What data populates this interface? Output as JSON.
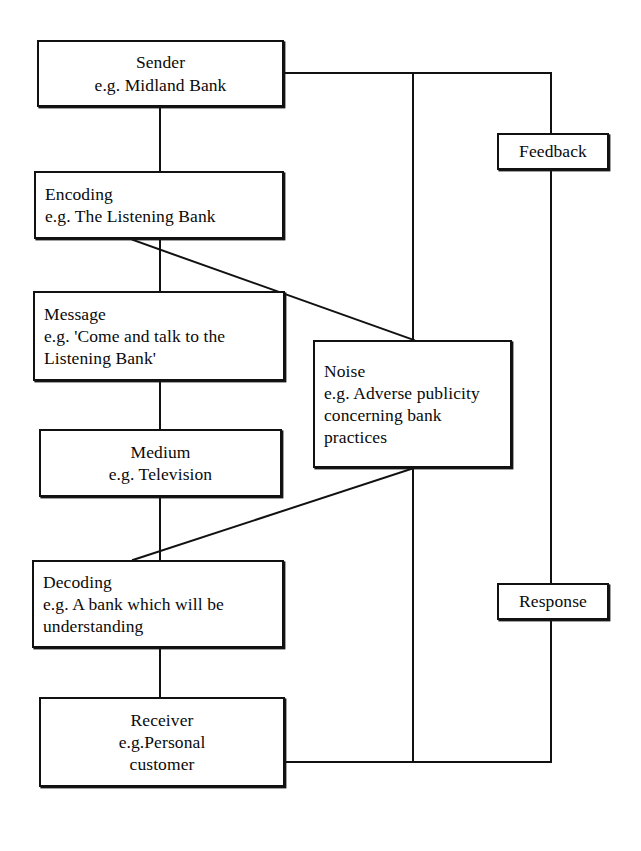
{
  "diagram": {
    "style": {
      "line_color": "#111111",
      "box_border_color": "#111111",
      "background": "#ffffff",
      "text_color": "#0a0a0a"
    },
    "nodes": [
      {
        "id": "sender",
        "label": "Sender\ne.g. Midland Bank",
        "align": "center",
        "x": 37,
        "y": 40,
        "w": 247,
        "h": 67
      },
      {
        "id": "encoding",
        "label": "Encoding\ne.g. The Listening Bank",
        "align": "left",
        "x": 34,
        "y": 171,
        "w": 250,
        "h": 68
      },
      {
        "id": "message",
        "label": "Message\ne.g. 'Come and talk to the\nListening Bank'",
        "align": "left",
        "x": 33,
        "y": 291,
        "w": 252,
        "h": 90
      },
      {
        "id": "medium",
        "label": "Medium\ne.g. Television",
        "align": "center",
        "x": 39,
        "y": 429,
        "w": 243,
        "h": 68
      },
      {
        "id": "decoding",
        "label": "Decoding\ne.g. A bank which will be\nunderstanding",
        "align": "left",
        "x": 32,
        "y": 560,
        "w": 252,
        "h": 88
      },
      {
        "id": "receiver",
        "label": "Receiver\ne.g.Personal\ncustomer",
        "align": "center",
        "x": 39,
        "y": 697,
        "w": 246,
        "h": 90
      },
      {
        "id": "noise",
        "label": "Noise\ne.g. Adverse publicity\nconcerning bank\npractices",
        "align": "left",
        "x": 313,
        "y": 340,
        "w": 199,
        "h": 128
      },
      {
        "id": "feedback",
        "label": "Feedback",
        "align": "center",
        "x": 497,
        "y": 133,
        "w": 112,
        "h": 37
      },
      {
        "id": "response",
        "label": "Response",
        "align": "center",
        "x": 497,
        "y": 583,
        "w": 112,
        "h": 37
      }
    ],
    "connectors": [
      {
        "id": "sender-to-encoding",
        "type": "vertical",
        "points": "160,107 160,171"
      },
      {
        "id": "encoding-to-message",
        "type": "vertical",
        "points": "160,239 160,291"
      },
      {
        "id": "message-to-medium",
        "type": "vertical",
        "points": "160,381 160,429"
      },
      {
        "id": "medium-to-decoding",
        "type": "vertical",
        "points": "160,497 160,560"
      },
      {
        "id": "decoding-to-receiver",
        "type": "vertical",
        "points": "160,648 160,697"
      },
      {
        "id": "encoding-to-noise-diagonal",
        "type": "diagonal",
        "points": "133,240 414,340"
      },
      {
        "id": "noise-to-decoding-diagonal",
        "type": "diagonal",
        "points": "414,468 133,560"
      },
      {
        "id": "sender-to-feedback",
        "type": "polyline",
        "points": "284,73 551,73 551,133"
      },
      {
        "id": "feedback-to-receiver",
        "type": "polyline",
        "points": "551,170 551,583"
      },
      {
        "id": "response-down",
        "type": "polyline",
        "points": "551,620 551,762 285,762"
      },
      {
        "id": "noise-vertical-spine",
        "type": "vertical",
        "points": "413,73 413,340"
      },
      {
        "id": "noise-vertical-spine-lower",
        "type": "vertical",
        "points": "413,468 413,762"
      }
    ]
  }
}
